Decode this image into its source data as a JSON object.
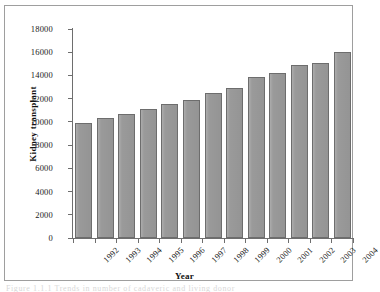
{
  "figure": {
    "caption_fragment": "Figure 1.1.1  Trends in number of cadaveric and living donor"
  },
  "chart_data": {
    "type": "bar",
    "title": "",
    "xlabel": "Year",
    "ylabel": "Kidney transplant",
    "categories": [
      "1992",
      "1993",
      "1994",
      "1995",
      "1996",
      "1997",
      "1998",
      "1999",
      "2000",
      "2001",
      "2002",
      "2003",
      "2004"
    ],
    "values": [
      9900,
      10300,
      10700,
      11100,
      11500,
      11900,
      12500,
      12950,
      13900,
      14200,
      14900,
      15100,
      16000
    ],
    "ylim": [
      0,
      18000
    ],
    "ytick_step": 2000,
    "yticks": [
      "0",
      "2000",
      "4000",
      "6000",
      "8000",
      "10000",
      "12000",
      "14000",
      "16000",
      "18000"
    ],
    "ytick_values": [
      0,
      2000,
      4000,
      6000,
      8000,
      10000,
      12000,
      14000,
      16000,
      18000
    ],
    "grid": false,
    "legend": null,
    "bar_color": "#9a9a9a",
    "bar_edge_color": "#6d6d6d",
    "axis_color": "#6e6e6e",
    "frame_color": "#9e9e9e",
    "background_color": "#ffffff",
    "xtick_rotation": -45
  }
}
